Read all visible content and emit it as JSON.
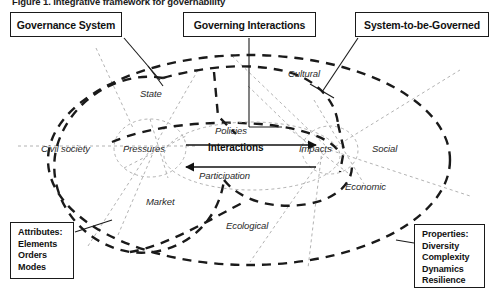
{
  "figure": {
    "caption": "Figure 1. Integrative framework for governability"
  },
  "headers": [
    {
      "id": "governance-system",
      "label": "Governance System"
    },
    {
      "id": "governing-interactions",
      "label": "Governing Interactions"
    },
    {
      "id": "system-to-be-governed",
      "label": "System-to-be-Governed"
    }
  ],
  "corner_boxes": {
    "attributes": {
      "title": "Attributes:",
      "items": [
        "Elements",
        "Orders",
        "Modes"
      ]
    },
    "properties": {
      "title": "Properties:",
      "items": [
        "Diversity",
        "Complexity",
        "Dynamics",
        "Resilience"
      ]
    }
  },
  "governance_zones": [
    {
      "id": "state",
      "label": "State"
    },
    {
      "id": "civil-society",
      "label": "Civil society"
    },
    {
      "id": "market",
      "label": "Market"
    }
  ],
  "governed_zones": [
    {
      "id": "cultural",
      "label": "Cultural"
    },
    {
      "id": "social",
      "label": "Social"
    },
    {
      "id": "economic",
      "label": "Economic"
    },
    {
      "id": "ecological",
      "label": "Ecological"
    }
  ],
  "interaction_zone": {
    "left_node": "Pressures",
    "right_node": "Impacts",
    "center_label": "Interactions",
    "top_flow": "Policies",
    "bottom_flow": "Participation"
  },
  "colors": {
    "ink": "#1a1a1a",
    "bold_dash": "#1a1a1a",
    "faint_dash": "#9a9a9a",
    "background": "#ffffff"
  }
}
